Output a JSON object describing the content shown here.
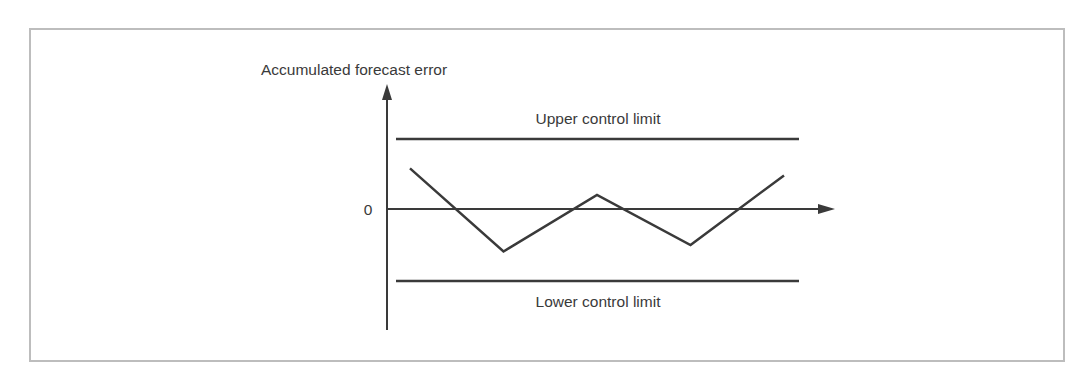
{
  "chart_data": {
    "type": "line",
    "title": "",
    "ylabel": "Accumulated forecast error",
    "xlabel": "",
    "y_zero_label": "0",
    "upper_limit": {
      "label": "Upper control limit",
      "value": 1.0
    },
    "lower_limit": {
      "label": "Lower control limit",
      "value": -1.0
    },
    "series": [
      {
        "name": "Accumulated forecast error",
        "x": [
          0,
          1,
          2,
          3,
          4
        ],
        "values": [
          0.58,
          -0.59,
          0.2,
          -0.5,
          0.48
        ]
      }
    ],
    "ylim": [
      -1.7,
      1.75
    ],
    "grid": false,
    "legend": "none"
  },
  "colors": {
    "line": "#3a3a3a",
    "frame": "#bdbdbd",
    "text": "#3a3a3a"
  }
}
